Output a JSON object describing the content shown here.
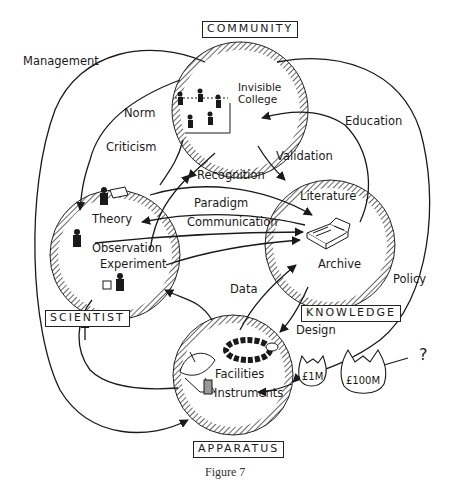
{
  "diagram": {
    "caption": "Figure 7",
    "nodes": {
      "community": {
        "title": "COMMUNITY",
        "inner": [
          "Invisible",
          "College"
        ]
      },
      "scientist": {
        "title": "SCIENTIST",
        "inner": [
          "Theory",
          "Observation",
          "Experiment"
        ]
      },
      "knowledge": {
        "title": "KNOWLEDGE",
        "inner": [
          "Literature",
          "Archive"
        ]
      },
      "apparatus": {
        "title": "APPARATUS",
        "inner": [
          "Facilities",
          "Instruments"
        ]
      }
    },
    "edges": {
      "management": "Management",
      "norm": "Norm",
      "criticism": "Criticism",
      "recognition": "Recognition",
      "validation": "Validation",
      "education": "Education",
      "paradigm": "Paradigm",
      "communication": "Communication",
      "data": "Data",
      "design": "Design",
      "policy": "Policy"
    },
    "funding": {
      "small": "£1M",
      "large": "£100M",
      "unknown": "?"
    },
    "colors": {
      "ink": "#1a1a1a",
      "background": "#ffffff"
    }
  }
}
